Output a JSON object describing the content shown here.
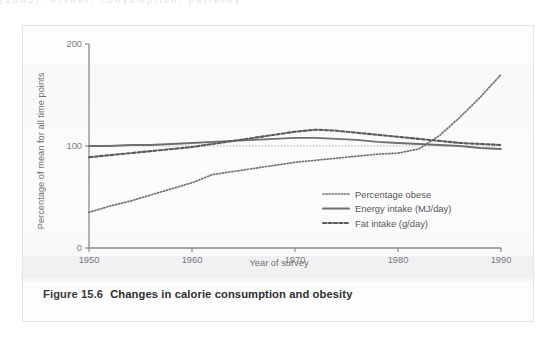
{
  "page": {
    "top_artifact": "(2005), Fisher, consumption, patterns"
  },
  "figure": {
    "number": "Figure 15.6",
    "caption": "Changes in calorie consumption and obesity"
  },
  "chart_data": {
    "type": "line",
    "title": "",
    "xlabel": "Year of survey",
    "ylabel": "Percentage of mean for all time points",
    "xlim": [
      1950,
      1990
    ],
    "ylim": [
      0,
      200
    ],
    "xticks": [
      "1950",
      "1960",
      "1970",
      "1980",
      "1990"
    ],
    "yticks": [
      "0",
      "100",
      "200"
    ],
    "grid": false,
    "legend_position": "bottom-right",
    "x": [
      1950,
      1952,
      1954,
      1956,
      1958,
      1960,
      1962,
      1964,
      1966,
      1968,
      1970,
      1972,
      1974,
      1976,
      1978,
      1980,
      1982,
      1984,
      1986,
      1988,
      1990
    ],
    "series": [
      {
        "name": "Percentage obese",
        "style": "dotted",
        "color": "#6e6e73",
        "values": [
          35,
          41,
          46,
          52,
          58,
          64,
          72,
          75,
          78,
          81,
          84,
          86,
          88,
          90,
          92,
          93,
          97,
          110,
          128,
          148,
          170
        ]
      },
      {
        "name": "Energy intake (MJ/day)",
        "style": "solid",
        "color": "#6e6e73",
        "values": [
          100,
          100,
          101,
          101,
          102,
          103,
          104,
          105,
          106,
          107,
          108,
          108,
          107,
          106,
          104,
          103,
          102,
          101,
          100,
          98,
          97
        ]
      },
      {
        "name": "Fat intake (g/day)",
        "style": "dashed",
        "color": "#5a5a5f",
        "values": [
          89,
          91,
          93,
          95,
          97,
          99,
          102,
          105,
          108,
          111,
          114,
          116,
          115,
          113,
          111,
          109,
          107,
          105,
          103,
          102,
          101
        ]
      }
    ],
    "reference_line": {
      "name": "mean-100-reference",
      "value": 100,
      "style": "fine-dotted",
      "color": "#8e8e93"
    }
  }
}
